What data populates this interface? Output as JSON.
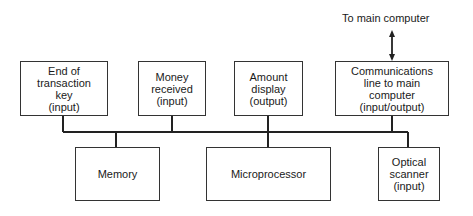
{
  "diagram": {
    "top_label": "To main computer",
    "top_boxes": [
      {
        "id": "end-of-transaction-key",
        "text": "End of\ntransaction\nkey\n(input)"
      },
      {
        "id": "money-received",
        "text": "Money\nreceived\n(input)"
      },
      {
        "id": "amount-display",
        "text": "Amount\ndisplay\n(output)"
      },
      {
        "id": "communications-line",
        "text": "Communications\nline to main\ncomputer\n(input/output)"
      }
    ],
    "bottom_boxes": [
      {
        "id": "memory",
        "text": "Memory"
      },
      {
        "id": "microprocessor",
        "text": "Microprocessor"
      },
      {
        "id": "optical-scanner",
        "text": "Optical\nscanner\n(input)"
      }
    ],
    "colors": {
      "line": "#222222",
      "border": "#333333",
      "background": "#ffffff"
    }
  }
}
